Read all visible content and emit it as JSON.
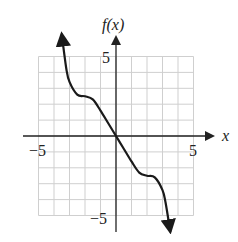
{
  "chart_data": {
    "type": "line",
    "title": "",
    "xlabel": "x",
    "ylabel": "f(x)",
    "xlim": [
      -5,
      5
    ],
    "ylim": [
      -5,
      5
    ],
    "grid": true,
    "grid_step": 1,
    "x_tick_labels": [
      {
        "value": -5,
        "label": "−5"
      },
      {
        "value": 5,
        "label": "5"
      }
    ],
    "y_tick_labels": [
      {
        "value": 5,
        "label": "5"
      },
      {
        "value": -5,
        "label": "−5"
      }
    ],
    "series": [
      {
        "name": "f(x)",
        "arrows": "both ends",
        "points": [
          {
            "x": -3.5,
            "y": 6.4
          },
          {
            "x": -3.2,
            "y": 4.2
          },
          {
            "x": -3.0,
            "y": 3.4
          },
          {
            "x": -2.5,
            "y": 2.6
          },
          {
            "x": -2.0,
            "y": 2.5
          },
          {
            "x": -1.5,
            "y": 2.3
          },
          {
            "x": -1.0,
            "y": 1.6
          },
          {
            "x": -0.5,
            "y": 0.8
          },
          {
            "x": 0.0,
            "y": 0.0
          },
          {
            "x": 0.5,
            "y": -0.8
          },
          {
            "x": 1.0,
            "y": -1.6
          },
          {
            "x": 1.5,
            "y": -2.3
          },
          {
            "x": 2.0,
            "y": -2.5
          },
          {
            "x": 2.5,
            "y": -2.6
          },
          {
            "x": 3.0,
            "y": -3.4
          },
          {
            "x": 3.2,
            "y": -4.2
          },
          {
            "x": 3.5,
            "y": -6.0
          }
        ]
      }
    ],
    "legend": "none"
  },
  "labels": {
    "y_axis_title": "f(x)",
    "x_axis_title": "x",
    "x_min": "−5",
    "x_max": "5",
    "y_max": "5",
    "y_min": "−5"
  }
}
